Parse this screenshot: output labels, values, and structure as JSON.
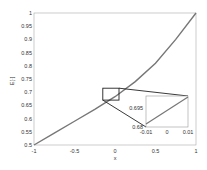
{
  "chart_data": {
    "type": "line",
    "title": "",
    "xlabel": "x",
    "ylabel": "E[·]",
    "xlim": [
      -1,
      1
    ],
    "ylim": [
      0.5,
      1
    ],
    "xticks": [
      "-1",
      "-0.5",
      "0",
      "0.5",
      "1"
    ],
    "yticks": [
      "0.5",
      "0.55",
      "0.6",
      "0.65",
      "0.7",
      "0.75",
      "0.8",
      "0.85",
      "0.9",
      "0.95",
      "1"
    ],
    "grid": false,
    "series": [
      {
        "name": "curve",
        "x": [
          -1,
          -0.75,
          -0.5,
          -0.25,
          0,
          0.25,
          0.5,
          0.75,
          1
        ],
        "y": [
          0.5,
          0.545,
          0.59,
          0.635,
          0.683,
          0.74,
          0.81,
          0.9,
          1.0
        ]
      }
    ],
    "inset": {
      "xlim": [
        -0.01,
        0.01
      ],
      "ylim": [
        0.68,
        0.695
      ],
      "xticks": [
        "-0.01",
        "0",
        "0.01"
      ],
      "yticks": [
        "0.68",
        "0.695"
      ],
      "zoom_region": {
        "x": [
          -0.1,
          0.1
        ],
        "y": [
          0.67,
          0.715
        ]
      }
    }
  }
}
